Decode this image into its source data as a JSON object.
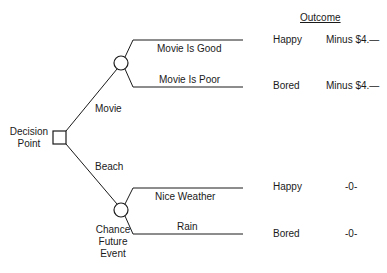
{
  "header": {
    "outcome_label": "Outcome"
  },
  "decision_node": {
    "label_line1": "Decision",
    "label_line2": "Point"
  },
  "alternatives": [
    {
      "label": "Movie"
    },
    {
      "label": "Beach"
    }
  ],
  "chance_node": {
    "label_line1": "Chance",
    "label_line2": "Future",
    "label_line3": "Event"
  },
  "branches": [
    {
      "label": "Movie Is Good",
      "outcome": "Happy",
      "value": "Minus $4.—"
    },
    {
      "label": "Movie Is Poor",
      "outcome": "Bored",
      "value": "Minus $4.—"
    },
    {
      "label": "Nice Weather",
      "outcome": "Happy",
      "value": "-0-"
    },
    {
      "label": "Rain",
      "outcome": "Bored",
      "value": "-0-"
    }
  ],
  "colors": {
    "line": "#1a1a1a",
    "background": "#ffffff"
  }
}
